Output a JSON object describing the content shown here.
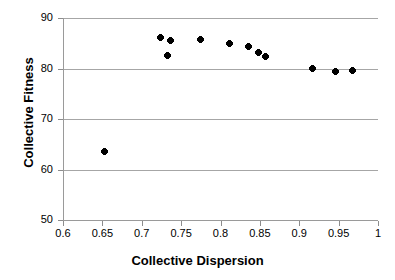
{
  "chart_data": {
    "type": "scatter",
    "title": "",
    "xlabel": "Collective Dispersion",
    "ylabel": "Collective Fitness",
    "xlim": [
      0.6,
      1
    ],
    "ylim": [
      50,
      90
    ],
    "grid": true,
    "legend": false,
    "legend_position": "none",
    "xticks": [
      0.6,
      0.65,
      0.7,
      0.75,
      0.8,
      0.85,
      0.9,
      0.95,
      1
    ],
    "xtick_labels": [
      "0.6",
      "0.65",
      "0.7",
      "0.75",
      "0.8",
      "0.85",
      "0.9",
      "0.95",
      "1"
    ],
    "yticks": [
      50,
      60,
      70,
      80,
      90
    ],
    "ytick_labels": [
      "50",
      "60",
      "70",
      "80",
      "90"
    ],
    "marker_style": "diamond",
    "marker_color": "#000000",
    "gridline_color": "#a6a6a6",
    "axis_color": "#9a9a9a",
    "series": [
      {
        "name": "Collective Fitness vs Collective Dispersion",
        "points": [
          {
            "x": 0.651,
            "y": 63.5
          },
          {
            "x": 0.723,
            "y": 86.1
          },
          {
            "x": 0.732,
            "y": 82.6
          },
          {
            "x": 0.735,
            "y": 85.5
          },
          {
            "x": 0.773,
            "y": 85.7
          },
          {
            "x": 0.81,
            "y": 85.0
          },
          {
            "x": 0.834,
            "y": 84.3
          },
          {
            "x": 0.847,
            "y": 83.1
          },
          {
            "x": 0.856,
            "y": 82.3
          },
          {
            "x": 0.916,
            "y": 80.0
          },
          {
            "x": 0.945,
            "y": 79.5
          },
          {
            "x": 0.966,
            "y": 79.7
          }
        ]
      }
    ]
  }
}
